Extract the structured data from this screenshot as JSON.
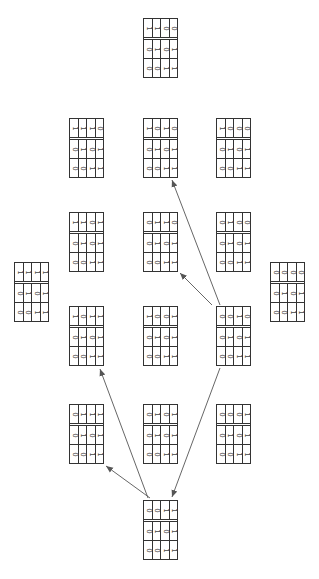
{
  "diagram": {
    "matrices": [
      {
        "id": "top",
        "x": 143,
        "y": 18,
        "rows": [
          [
            1,
            1,
            0,
            0
          ],
          [
            0,
            1,
            0,
            1
          ],
          [
            0,
            0,
            1,
            1
          ]
        ]
      },
      {
        "id": "r2-left",
        "x": 69,
        "y": 118,
        "rows": [
          [
            1,
            1,
            1,
            0
          ],
          [
            0,
            1,
            0,
            1
          ],
          [
            0,
            0,
            1,
            1
          ]
        ]
      },
      {
        "id": "r2-mid",
        "x": 143,
        "y": 118,
        "rows": [
          [
            1,
            0,
            1,
            0
          ],
          [
            0,
            1,
            0,
            1
          ],
          [
            0,
            0,
            1,
            1
          ]
        ]
      },
      {
        "id": "r2-right",
        "x": 216,
        "y": 118,
        "rows": [
          [
            1,
            0,
            0,
            0
          ],
          [
            0,
            1,
            0,
            1
          ],
          [
            0,
            0,
            1,
            1
          ]
        ]
      },
      {
        "id": "r3-left",
        "x": 69,
        "y": 212,
        "rows": [
          [
            1,
            1,
            0,
            1
          ],
          [
            0,
            1,
            0,
            1
          ],
          [
            0,
            0,
            1,
            1
          ]
        ]
      },
      {
        "id": "r3-mid",
        "x": 143,
        "y": 212,
        "rows": [
          [
            0,
            1,
            1,
            0
          ],
          [
            0,
            1,
            0,
            1
          ],
          [
            0,
            0,
            1,
            1
          ]
        ]
      },
      {
        "id": "r3-right",
        "x": 216,
        "y": 212,
        "rows": [
          [
            0,
            1,
            0,
            0
          ],
          [
            0,
            1,
            0,
            1
          ],
          [
            0,
            0,
            1,
            1
          ]
        ]
      },
      {
        "id": "far-left",
        "x": 14,
        "y": 262,
        "rows": [
          [
            1,
            1,
            1,
            1
          ],
          [
            0,
            1,
            0,
            1
          ],
          [
            0,
            0,
            1,
            1
          ]
        ]
      },
      {
        "id": "far-right",
        "x": 270,
        "y": 262,
        "rows": [
          [
            0,
            0,
            0,
            0
          ],
          [
            0,
            1,
            0,
            1
          ],
          [
            0,
            0,
            1,
            1
          ]
        ]
      },
      {
        "id": "r4-left",
        "x": 69,
        "y": 306,
        "rows": [
          [
            1,
            0,
            1,
            1
          ],
          [
            0,
            1,
            0,
            1
          ],
          [
            0,
            0,
            1,
            1
          ]
        ]
      },
      {
        "id": "r4-mid",
        "x": 143,
        "y": 306,
        "rows": [
          [
            1,
            0,
            0,
            1
          ],
          [
            0,
            1,
            0,
            1
          ],
          [
            0,
            0,
            1,
            1
          ]
        ]
      },
      {
        "id": "r4-right",
        "x": 216,
        "y": 306,
        "rows": [
          [
            0,
            0,
            1,
            0
          ],
          [
            0,
            1,
            0,
            1
          ],
          [
            0,
            0,
            1,
            1
          ]
        ]
      },
      {
        "id": "r5-left",
        "x": 69,
        "y": 404,
        "rows": [
          [
            0,
            1,
            1,
            1
          ],
          [
            0,
            1,
            0,
            1
          ],
          [
            0,
            0,
            1,
            1
          ]
        ]
      },
      {
        "id": "r5-mid",
        "x": 143,
        "y": 404,
        "rows": [
          [
            0,
            1,
            0,
            1
          ],
          [
            0,
            1,
            0,
            1
          ],
          [
            0,
            0,
            1,
            1
          ]
        ]
      },
      {
        "id": "r5-right",
        "x": 216,
        "y": 404,
        "rows": [
          [
            0,
            0,
            0,
            1
          ],
          [
            0,
            1,
            0,
            1
          ],
          [
            0,
            0,
            1,
            1
          ]
        ]
      },
      {
        "id": "bottom",
        "x": 143,
        "y": 500,
        "rows": [
          [
            0,
            0,
            1,
            1
          ],
          [
            0,
            1,
            0,
            1
          ],
          [
            0,
            0,
            1,
            1
          ]
        ]
      }
    ],
    "arrows": [
      {
        "from": "bottom",
        "to": "r5-left",
        "x1": 150,
        "y1": 498,
        "x2": 106,
        "y2": 466
      },
      {
        "from": "bottom",
        "to": "r4-left",
        "x1": 148,
        "y1": 498,
        "x2": 100,
        "y2": 369
      },
      {
        "from": "r4-right",
        "to": "bottom",
        "x1": 220,
        "y1": 368,
        "x2": 172,
        "y2": 497
      },
      {
        "from": "r4-right",
        "to": "r3-mid",
        "x1": 212,
        "y1": 305,
        "x2": 180,
        "y2": 273
      },
      {
        "from": "r4-right",
        "to": "r2-mid",
        "x1": 220,
        "y1": 305,
        "x2": 172,
        "y2": 180
      }
    ],
    "colors": {
      "line": "#333333",
      "arrow": "#555555"
    }
  }
}
